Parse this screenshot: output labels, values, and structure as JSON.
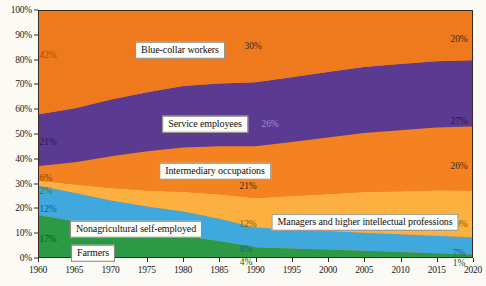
{
  "chart_data": {
    "type": "area",
    "title": "",
    "subtitle": "",
    "xlabel": "",
    "ylabel": "",
    "stacked": true,
    "normalized": true,
    "grid": false,
    "legend_position": "inline-labels",
    "x": [
      1960,
      1965,
      1970,
      1975,
      1980,
      1985,
      1990,
      1995,
      2000,
      2005,
      2010,
      2015,
      2020
    ],
    "xlim": [
      1960,
      2020
    ],
    "ylim": [
      0,
      100
    ],
    "x_ticks": [
      "1960",
      "1965",
      "1970",
      "1975",
      "1980",
      "1985",
      "1990",
      "1995",
      "2000",
      "2005",
      "2010",
      "2015",
      "2020"
    ],
    "y_ticks": [
      "0%",
      "10%",
      "20%",
      "30%",
      "40%",
      "50%",
      "60%",
      "70%",
      "80%",
      "90%",
      "100%"
    ],
    "series": [
      {
        "name": "Farmers",
        "color": "#2c9a45",
        "values": [
          17,
          14.5,
          12,
          10,
          8.5,
          6.5,
          4,
          3.5,
          3,
          2.5,
          2,
          1.5,
          1
        ]
      },
      {
        "name": "Nonagricultural self-employed",
        "color": "#3fa9dd",
        "values": [
          12,
          11.5,
          11,
          10.5,
          10,
          9,
          8,
          7.8,
          7.6,
          7.4,
          7.2,
          7.1,
          7
        ]
      },
      {
        "name": "Managers and higher intellectual professions",
        "color": "#fbb040",
        "values": [
          2,
          3.5,
          5,
          6.5,
          8,
          10,
          12,
          13.5,
          15,
          16.5,
          17.5,
          18.5,
          19
        ]
      },
      {
        "name": "Intermediary occupations",
        "color": "#f58220",
        "values": [
          6,
          9,
          13,
          16,
          18,
          19.5,
          21,
          22,
          23,
          24,
          24.8,
          25.5,
          26
        ]
      },
      {
        "name": "Service employees",
        "color": "#5b3b92",
        "values": [
          21,
          22,
          23,
          24,
          25,
          25.5,
          26,
          26.3,
          26.6,
          26.8,
          27,
          27,
          27
        ]
      },
      {
        "name": "Blue-collar workers",
        "color": "#ef7a1e",
        "values": [
          42,
          39.5,
          36,
          33,
          30.5,
          29.5,
          29,
          26.9,
          24.8,
          22.8,
          21.5,
          20.4,
          20
        ]
      }
    ],
    "annotations": [
      {
        "text": "42%",
        "x": 1960,
        "series": "Blue-collar workers",
        "color": "#b24a00"
      },
      {
        "text": "30%",
        "x": 1990,
        "series": "Blue-collar workers",
        "color": "#3a2a20"
      },
      {
        "text": "20%",
        "x": 2020,
        "series": "Blue-collar workers",
        "color": "#3a2a20"
      },
      {
        "text": "21%",
        "x": 1960,
        "series": "Service employees",
        "color": "#2a1550"
      },
      {
        "text": "26%",
        "x": 1990,
        "series": "Service employees",
        "color": "#8f7fc0"
      },
      {
        "text": "27%",
        "x": 2020,
        "series": "Service employees",
        "color": "#2a1550"
      },
      {
        "text": "6%",
        "x": 1960,
        "series": "Intermediary occupations",
        "color": "#8a3d00"
      },
      {
        "text": "21%",
        "x": 1990,
        "series": "Intermediary occupations",
        "color": "#3a2a20"
      },
      {
        "text": "26%",
        "x": 2020,
        "series": "Intermediary occupations",
        "color": "#3a2a20"
      },
      {
        "text": "2%",
        "x": 1960,
        "series": "Managers and higher intellectual professions",
        "color": "#8a5a00"
      },
      {
        "text": "12%",
        "x": 1990,
        "series": "Managers and higher intellectual professions",
        "color": "#8a5a00"
      },
      {
        "text": "19%",
        "x": 2020,
        "series": "Managers and higher intellectual professions",
        "color": "#8a5a00"
      },
      {
        "text": "12%",
        "x": 1960,
        "series": "Nonagricultural self-employed",
        "color": "#17628f"
      },
      {
        "text": "8%",
        "x": 1990,
        "series": "Nonagricultural self-employed",
        "color": "#17628f"
      },
      {
        "text": "7%",
        "x": 2020,
        "series": "Nonagricultural self-employed",
        "color": "#17628f"
      },
      {
        "text": "17%",
        "x": 1960,
        "series": "Farmers",
        "color": "#0d5c22"
      },
      {
        "text": "4%",
        "x": 1990,
        "series": "Farmers",
        "color": "#0d5c22"
      },
      {
        "text": "1%",
        "x": 2020,
        "series": "Farmers",
        "color": "#0d5c22"
      }
    ]
  },
  "series_labels": [
    {
      "text": "Blue-collar workers",
      "left": 180,
      "top": 50
    },
    {
      "text": "Service employees",
      "left": 205,
      "top": 124
    },
    {
      "text": "Intermediary occupations",
      "left": 215,
      "top": 171
    },
    {
      "text": "Managers and higher intellectual professions",
      "left": 365,
      "top": 222
    },
    {
      "text": "Nonagricultural self-employed",
      "left": 136,
      "top": 229
    },
    {
      "text": "Farmers",
      "left": 93,
      "top": 253
    }
  ],
  "value_annotations": [
    {
      "text": "42%",
      "left": 48,
      "top": 55,
      "color": "#b24a00"
    },
    {
      "text": "30%",
      "left": 253,
      "top": 46,
      "color": "#3a2a20"
    },
    {
      "text": "20%",
      "left": 459,
      "top": 39,
      "color": "#3a2a20"
    },
    {
      "text": "21%",
      "left": 48,
      "top": 142,
      "color": "#2a1550"
    },
    {
      "text": "26%",
      "left": 270,
      "top": 124,
      "color": "#9d8fcd"
    },
    {
      "text": "27%",
      "left": 459,
      "top": 121,
      "color": "#2a1550"
    },
    {
      "text": "6%",
      "left": 46,
      "top": 178,
      "color": "#8a3d00"
    },
    {
      "text": "21%",
      "left": 248,
      "top": 186,
      "color": "#3a2a20"
    },
    {
      "text": "26%",
      "left": 459,
      "top": 166,
      "color": "#3a2a20"
    },
    {
      "text": "2%",
      "left": 46,
      "top": 191,
      "color": "#8a5a00"
    },
    {
      "text": "12%",
      "left": 248,
      "top": 224,
      "color": "#8a5a00"
    },
    {
      "text": "19%",
      "left": 459,
      "top": 224,
      "color": "#8a5a00"
    },
    {
      "text": "12%",
      "left": 48,
      "top": 209,
      "color": "#17628f"
    },
    {
      "text": "8%",
      "left": 246,
      "top": 249,
      "color": "#17628f"
    },
    {
      "text": "7%",
      "left": 459,
      "top": 253,
      "color": "#17628f"
    },
    {
      "text": "17%",
      "left": 48,
      "top": 239,
      "color": "#0d5c22"
    },
    {
      "text": "4%",
      "left": 246,
      "top": 262,
      "color": "#0d5c22"
    },
    {
      "text": "1%",
      "left": 459,
      "top": 263,
      "color": "#0d5c22"
    }
  ]
}
